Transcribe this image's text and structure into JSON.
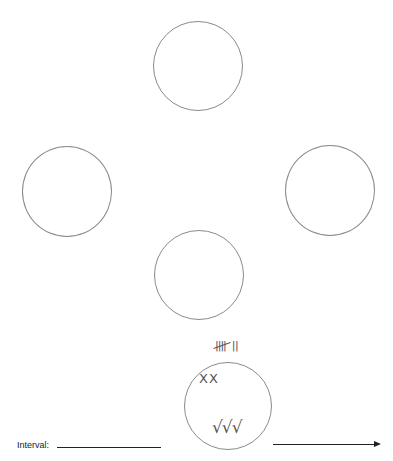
{
  "diagram": {
    "circles": [
      {
        "id": "top",
        "cx": 198,
        "cy": 66,
        "r": 45
      },
      {
        "id": "left",
        "cx": 67,
        "cy": 191,
        "r": 45
      },
      {
        "id": "right",
        "cx": 330,
        "cy": 190,
        "r": 45
      },
      {
        "id": "middle",
        "cx": 199,
        "cy": 275,
        "r": 45
      },
      {
        "id": "bottom",
        "cx": 228,
        "cy": 405,
        "r": 44
      }
    ],
    "tally": {
      "text": "𝍸 ||",
      "count": 7
    },
    "marks": {
      "crosses": "XX",
      "checks": "√√√"
    },
    "interval": {
      "label": "Interval:",
      "value": ""
    },
    "arrow": {
      "direction": "right"
    },
    "colors": {
      "circle_stroke": "#8a8a8a",
      "ink": "#222222",
      "handwriting": "#555555"
    }
  }
}
